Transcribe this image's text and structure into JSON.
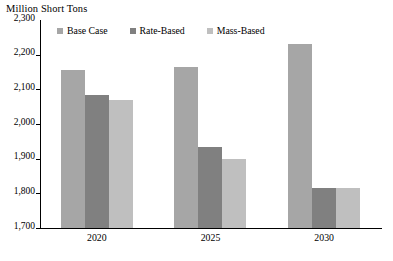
{
  "chart_data": {
    "type": "bar",
    "title": "",
    "ylabel": "Million Short Tons",
    "xlabel": "",
    "categories": [
      "2020",
      "2025",
      "2030"
    ],
    "series": [
      {
        "name": "Base Case",
        "values": [
          2155,
          2165,
          2230
        ],
        "color": "#a6a6a6"
      },
      {
        "name": "Rate-Based",
        "values": [
          2085,
          1935,
          1815
        ],
        "color": "#808080"
      },
      {
        "name": "Mass-Based",
        "values": [
          2070,
          1900,
          1815
        ],
        "color": "#bfbfbf"
      }
    ],
    "ylim": [
      1700,
      2300
    ],
    "ytick_labels": [
      "2,300",
      "2,200",
      "2,100",
      "2,000",
      "1,900",
      "1,800",
      "1,700"
    ],
    "ytick_values": [
      2300,
      2200,
      2100,
      2000,
      1900,
      1800,
      1700
    ],
    "grid": false,
    "legend_position": "top-left-inside"
  },
  "axis": {
    "unit_title": "Million Short Tons"
  },
  "legend": {
    "items": [
      {
        "label": "Base Case"
      },
      {
        "label": "Rate-Based"
      },
      {
        "label": "Mass-Based"
      }
    ]
  }
}
